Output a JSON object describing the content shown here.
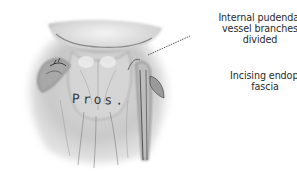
{
  "figure": {
    "type": "surgical anatomical illustration",
    "style": "grayscale pencil drawing",
    "organ_label": "Pros.",
    "labels": [
      {
        "id": "vessel",
        "lines": [
          "Internal pudendal",
          "vessel branches",
          "divided"
        ],
        "text": "Internal pudendal vessel branches divided"
      },
      {
        "id": "fascia",
        "lines": [
          "Incising endopelvic",
          "fascia"
        ],
        "text": "Incising endopelvic fascia"
      }
    ],
    "colors": {
      "background": "#ffffff",
      "ink": "#2a2a2a",
      "tissue_light": "#e6e6e6",
      "tissue_mid": "#b8b8b8",
      "tissue_dark": "#5a5a5a"
    }
  }
}
